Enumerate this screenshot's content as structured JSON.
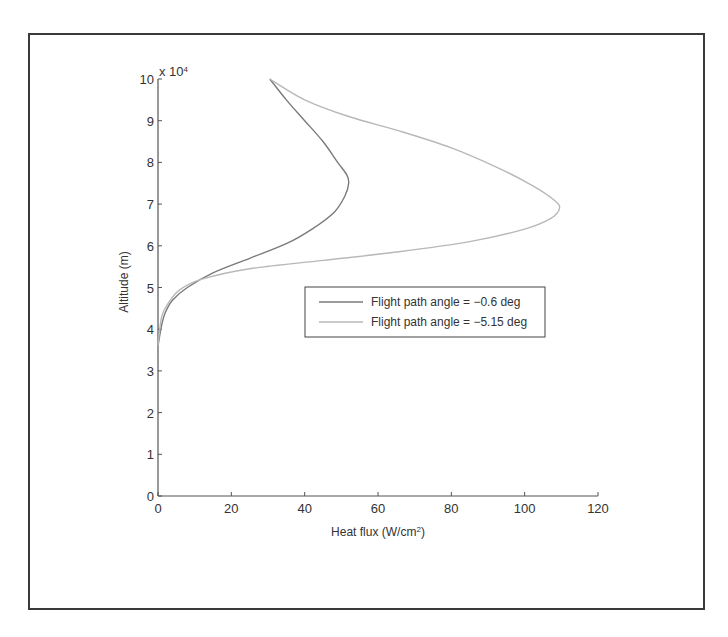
{
  "chart_data": {
    "type": "line",
    "title": "",
    "xlabel": "Heat flux (W/cm²)",
    "xlabel_base": "Heat flux (W/cm",
    "xlabel_sup": "2",
    "xlabel_tail": ")",
    "ylabel": "Altitude (m)",
    "y_multiplier": "x 10",
    "y_multiplier_exp": "4",
    "xlim": [
      0,
      120
    ],
    "ylim": [
      0,
      100000
    ],
    "xticks": [
      "0",
      "20",
      "40",
      "60",
      "80",
      "100",
      "120"
    ],
    "yticks": [
      "0",
      "1",
      "2",
      "3",
      "4",
      "5",
      "6",
      "7",
      "8",
      "9",
      "10"
    ],
    "grid": false,
    "legend_position": "center-right",
    "series": [
      {
        "name": "Flight path angle = −0.6 deg",
        "color": "#7a7a7a",
        "x": [
          30.5,
          35,
          40,
          45,
          49,
          51.5,
          52,
          51,
          48,
          42,
          35,
          25,
          15,
          8,
          4,
          2,
          1,
          0
        ],
        "y": [
          100000,
          95000,
          90000,
          85000,
          80000,
          77000,
          75000,
          72000,
          68000,
          64000,
          60500,
          57000,
          53500,
          50000,
          47000,
          44000,
          41000,
          36000
        ]
      },
      {
        "name": "Flight path angle = −5.15 deg",
        "color": "#b8b8b8",
        "x": [
          30.5,
          40,
          52,
          66,
          80,
          92,
          102,
          108,
          109.5,
          107,
          100,
          85,
          65,
          45,
          25,
          12,
          6,
          3,
          1,
          0
        ],
        "y": [
          100000,
          95000,
          91000,
          87500,
          83500,
          79000,
          74500,
          71000,
          69000,
          66500,
          64000,
          61000,
          58500,
          56500,
          54500,
          52000,
          49500,
          46500,
          43000,
          36000
        ]
      }
    ]
  }
}
